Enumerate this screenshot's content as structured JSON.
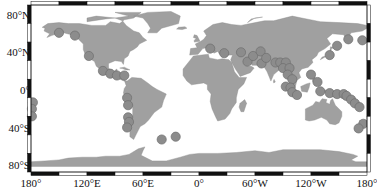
{
  "map": {
    "projection": "equirectangular",
    "land_color": "#a0a0a0",
    "ocean_color": "#ffffff",
    "marker_fill": "#8c8c8c",
    "marker_stroke": "#6f6f6f",
    "frame_colors": [
      "#111111",
      "#ffffff"
    ],
    "y_axis_labels": [
      {
        "text": "80°N",
        "y": 16
      },
      {
        "text": "40°N",
        "y": 53
      },
      {
        "text": "0°",
        "y": 91
      },
      {
        "text": "40°S",
        "y": 129
      },
      {
        "text": "80°S",
        "y": 166
      }
    ],
    "x_axis_labels": [
      {
        "text": "180°",
        "x": 31
      },
      {
        "text": "120°E",
        "x": 87
      },
      {
        "text": "60°E",
        "x": 143
      },
      {
        "text": "0°",
        "x": 199
      },
      {
        "text": "60°W",
        "x": 255
      },
      {
        "text": "120°W",
        "x": 311
      },
      {
        "text": "180°",
        "x": 367
      }
    ],
    "markers": [
      {
        "lon": -150,
        "lat": 60
      },
      {
        "lon": -133,
        "lat": 57
      },
      {
        "lon": -118,
        "lat": 35
      },
      {
        "lon": -103,
        "lat": 19
      },
      {
        "lon": -95,
        "lat": 16
      },
      {
        "lon": -88,
        "lat": 14
      },
      {
        "lon": -80,
        "lat": 14
      },
      {
        "lon": -77,
        "lat": -10
      },
      {
        "lon": -76,
        "lat": -18
      },
      {
        "lon": -76,
        "lat": -31
      },
      {
        "lon": -75,
        "lat": -36
      },
      {
        "lon": -77,
        "lat": -42
      },
      {
        "lon": -40,
        "lat": -55
      },
      {
        "lon": -25,
        "lat": -52
      },
      {
        "lon": -178,
        "lat": -15
      },
      {
        "lon": -179,
        "lat": -22
      },
      {
        "lon": -179,
        "lat": -30
      },
      {
        "lon": 12,
        "lat": 43
      },
      {
        "lon": 27,
        "lat": 38
      },
      {
        "lon": 45,
        "lat": 39
      },
      {
        "lon": 52,
        "lat": 29
      },
      {
        "lon": 58,
        "lat": 35
      },
      {
        "lon": 66,
        "lat": 40
      },
      {
        "lon": 67,
        "lat": 27
      },
      {
        "lon": 72,
        "lat": 33
      },
      {
        "lon": 82,
        "lat": 28
      },
      {
        "lon": 87,
        "lat": 28
      },
      {
        "lon": 93,
        "lat": 28
      },
      {
        "lon": 90,
        "lat": 22
      },
      {
        "lon": 97,
        "lat": 22
      },
      {
        "lon": 95,
        "lat": 15
      },
      {
        "lon": 100,
        "lat": 10
      },
      {
        "lon": 93,
        "lat": 2
      },
      {
        "lon": 98,
        "lat": 1
      },
      {
        "lon": 100,
        "lat": -4
      },
      {
        "lon": 105,
        "lat": -7
      },
      {
        "lon": 120,
        "lat": 15
      },
      {
        "lon": 127,
        "lat": 7
      },
      {
        "lon": 140,
        "lat": 36
      },
      {
        "lon": 148,
        "lat": 46
      },
      {
        "lon": 160,
        "lat": 53
      },
      {
        "lon": 175,
        "lat": 52
      },
      {
        "lon": 130,
        "lat": -3
      },
      {
        "lon": 140,
        "lat": -5
      },
      {
        "lon": 148,
        "lat": -6
      },
      {
        "lon": 155,
        "lat": -6
      },
      {
        "lon": 158,
        "lat": -8
      },
      {
        "lon": 163,
        "lat": -12
      },
      {
        "lon": 167,
        "lat": -16
      },
      {
        "lon": 172,
        "lat": -20
      },
      {
        "lon": 176,
        "lat": -38
      },
      {
        "lon": 171,
        "lat": -43
      }
    ]
  }
}
